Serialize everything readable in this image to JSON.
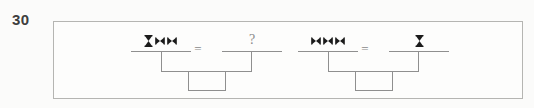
{
  "question": {
    "number": "30"
  },
  "colors": {
    "page_bg": "#fbfbfa",
    "panel_bg": "#fdfdfc",
    "panel_border": "#b5b5b2",
    "line": "#8f8f8f",
    "symbol": "#1b1b1b",
    "text": "#8a8a8a",
    "label": "#3e3e3e"
  },
  "equations": [
    {
      "left_symbols": [
        "hourglass-icon",
        "bowtie-icon",
        "bowtie-icon"
      ],
      "equals_sign": "=",
      "right_value": "?",
      "right_symbols": []
    },
    {
      "left_symbols": [
        "bowtie-icon",
        "bowtie-icon",
        "bowtie-icon"
      ],
      "equals_sign": "=",
      "right_value": "",
      "right_symbols": [
        "hourglass-icon"
      ]
    }
  ]
}
